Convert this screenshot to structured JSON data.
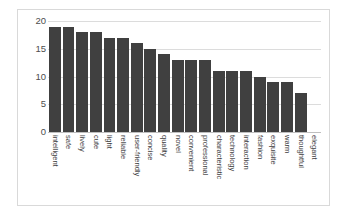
{
  "chart_data": {
    "type": "bar",
    "title": "",
    "subtitle": "",
    "xlabel": "",
    "ylabel": "",
    "ylim": [
      0,
      20
    ],
    "yticks": [
      "0",
      "5",
      "10",
      "15",
      "20"
    ],
    "ytick_values": [
      0,
      5,
      10,
      15,
      20
    ],
    "grid": true,
    "legend": false,
    "legend_position": "none",
    "bar_color": "#404040",
    "gridline_color": "#dcdcdc",
    "axis_text_color": "#4d4d4d",
    "categories": [
      "intelligent",
      "safe",
      "lively",
      "cute",
      "light",
      "reliable",
      "user-friendly",
      "concise",
      "quality",
      "novel",
      "convenient",
      "professional",
      "characteristic",
      "technology",
      "interaction",
      "fashion",
      "exquisite",
      "warm",
      "thoughtful",
      "elegant"
    ],
    "values": [
      19,
      19,
      18,
      18,
      17,
      17,
      16,
      15,
      14,
      13,
      13,
      13,
      11,
      11,
      11,
      10,
      9,
      9,
      7,
      0
    ]
  }
}
